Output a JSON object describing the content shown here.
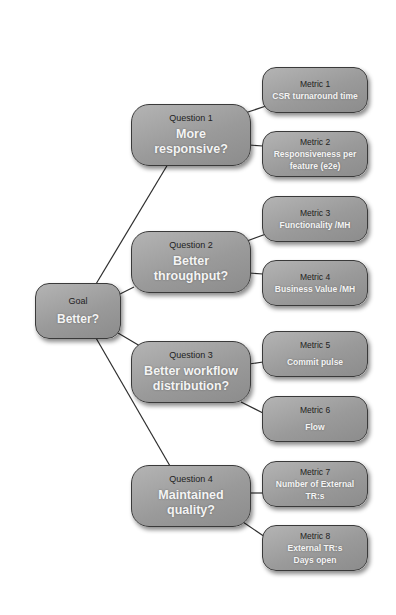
{
  "diagram": {
    "type": "GQM tree (Goal-Question-Metric)",
    "goal": {
      "label": "Goal",
      "text": "Better?"
    },
    "questions": [
      {
        "label": "Question 1",
        "text": "More responsive?"
      },
      {
        "label": "Question 2",
        "text": "Better throughput?"
      },
      {
        "label": "Question 3",
        "text": "Better workflow distribution?"
      },
      {
        "label": "Question 4",
        "text": "Maintained quality?"
      }
    ],
    "metrics": [
      {
        "label": "Metric 1",
        "text": "CSR turnaround time",
        "question": 1
      },
      {
        "label": "Metric 2",
        "text": "Responsiveness per feature (e2e)",
        "question": 1
      },
      {
        "label": "Metric 3",
        "text": "Functionality /MH",
        "question": 2
      },
      {
        "label": "Metric 4",
        "text": "Business Value /MH",
        "question": 2
      },
      {
        "label": "Metric 5",
        "text": "Commit pulse",
        "question": 3
      },
      {
        "label": "Metric 6",
        "text": "Flow",
        "question": 3
      },
      {
        "label": "Metric 7",
        "text": "Number of External TR:s",
        "question": 4
      },
      {
        "label": "Metric 8",
        "text": "External TR:s Days open",
        "question": 4
      }
    ],
    "colors": {
      "node_fill": "#9e9e9e",
      "node_border": "#3a3a3a",
      "label_text": "#1e1e1e",
      "value_text": "#f4f4f4",
      "connector": "#2e2e2e"
    }
  }
}
